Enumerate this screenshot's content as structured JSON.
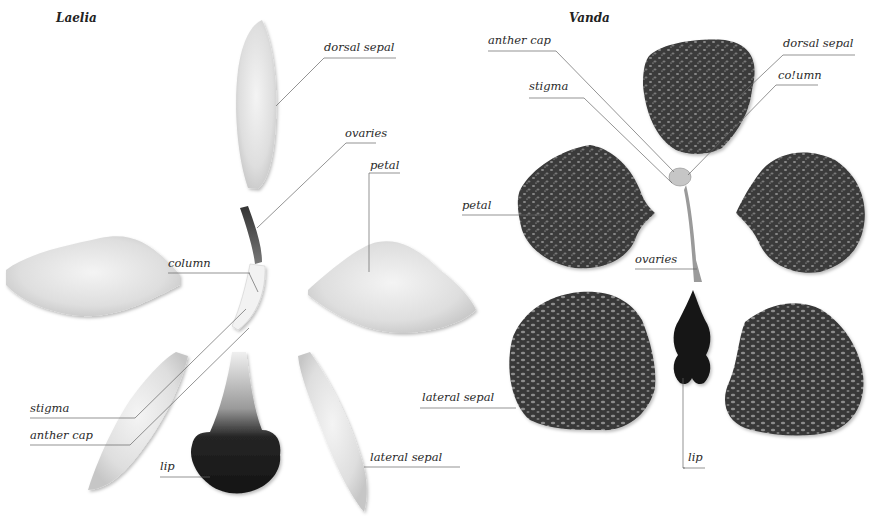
{
  "diagram": {
    "left": {
      "title": "Laelia",
      "labels": {
        "dorsal_sepal": "dorsal sepal",
        "ovaries": "ovaries",
        "petal": "petal",
        "column": "column",
        "stigma": "stigma",
        "anther_cap": "anther cap",
        "lip": "lip",
        "lateral_sepal": "lateral sepal"
      },
      "colors": {
        "petal_fill": "#e4e4e4",
        "lip_fill": "#1e1e1e",
        "ovary_fill": "#4a4a4a"
      }
    },
    "right": {
      "title": "Vanda",
      "labels": {
        "anther_cap": "anther cap",
        "dorsal_sepal": "dorsal sepal",
        "column": "co!umn",
        "stigma": "stigma",
        "petal": "petal",
        "ovaries": "ovaries",
        "lateral_sepal": "lateral sepal",
        "lip": "lip"
      },
      "colors": {
        "petal_fill": "#3a3a3a",
        "spot_fill": "#8a8a8a",
        "lip_fill": "#111111"
      }
    },
    "leader_line_color": "#555555"
  }
}
